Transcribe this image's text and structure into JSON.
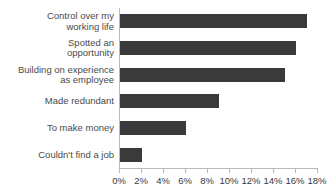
{
  "chart_data": {
    "type": "bar",
    "orientation": "horizontal",
    "title": "",
    "subtitle": "",
    "xlabel": "",
    "ylabel": "",
    "categories": [
      "Control over my\nworking life",
      "Spotted an\nopportunity",
      "Building on experience\nas employee",
      "Made redundant",
      "To make money",
      "Couldn't find a job"
    ],
    "values": [
      17,
      16,
      15,
      9,
      6,
      2
    ],
    "value_unit": "%",
    "xlim": [
      0,
      18
    ],
    "xticks": [
      0,
      2,
      4,
      6,
      8,
      10,
      12,
      14,
      16,
      18
    ],
    "xtick_labels": [
      "0%",
      "2%",
      "4%",
      "6%",
      "8%",
      "10%",
      "12%",
      "14%",
      "16%",
      "18%"
    ],
    "grid": false,
    "legend": null,
    "bar_color": "#3a3a3a",
    "axis_color": "#b9b9b9",
    "label_color": "#4a4a4a",
    "tick_label_color": "#3a3a3a",
    "background": "#ffffff"
  }
}
